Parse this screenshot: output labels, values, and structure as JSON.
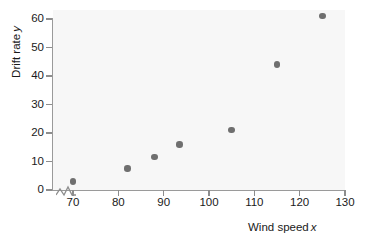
{
  "chart_data": {
    "type": "scatter",
    "title": "",
    "xlabel": "Wind speed",
    "xlabel_var": "x",
    "ylabel": "Drift rate",
    "ylabel_var": "y",
    "xlim": [
      66,
      130
    ],
    "ylim": [
      0,
      63
    ],
    "x_ticks": [
      70,
      80,
      90,
      100,
      110,
      120,
      130
    ],
    "y_ticks": [
      0,
      10,
      20,
      30,
      40,
      50,
      60
    ],
    "x_tick_labels": [
      "70",
      "80",
      "90",
      "100",
      "110",
      "120",
      "130"
    ],
    "y_tick_labels": [
      "0",
      "10",
      "20",
      "30",
      "40",
      "50",
      "60"
    ],
    "grid": false,
    "legend": null,
    "axis_break": "x-axis-zigzag-near-origin",
    "origin_label": "0",
    "point_color": "#6f6f6f",
    "plot_background": "#f7f7f7",
    "axis_color": "#9a9a9a",
    "x": [
      70,
      82,
      88,
      93.5,
      105,
      115,
      125
    ],
    "y": [
      3,
      7.5,
      11.5,
      16,
      21,
      44,
      61
    ],
    "points": [
      {
        "x": 70,
        "y": 3
      },
      {
        "x": 82,
        "y": 7.5
      },
      {
        "x": 88,
        "y": 11.5
      },
      {
        "x": 93.5,
        "y": 16
      },
      {
        "x": 105,
        "y": 21
      },
      {
        "x": 115,
        "y": 44
      },
      {
        "x": 125,
        "y": 61
      }
    ]
  }
}
